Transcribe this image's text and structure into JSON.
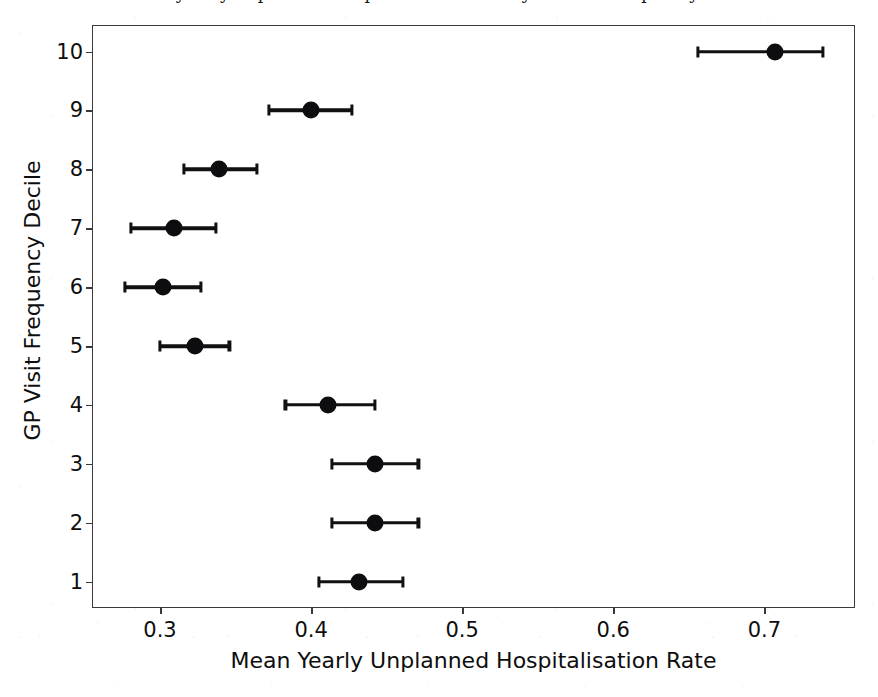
{
  "figure": {
    "width": 878,
    "height": 697,
    "background_color": "#ffffff",
    "frame_color": "#3a3a3c",
    "marker_color": "#0d0d0f",
    "title_cropped_note": "title row is cut off at the top edge of the screenshot; only letter descenders are visible"
  },
  "chart_data": {
    "type": "scatter",
    "orientation": "horizontal",
    "title": "",
    "xlabel": "Mean Yearly Unplanned Hospitalisation Rate",
    "ylabel": "GP Visit Frequency Decile",
    "xlim": [
      0.255,
      0.76
    ],
    "ylim": [
      0.55,
      10.45
    ],
    "xticks": [
      0.3,
      0.4,
      0.5,
      0.6,
      0.7
    ],
    "xtick_labels": [
      "0.3",
      "0.4",
      "0.5",
      "0.6",
      "0.7"
    ],
    "yticks": [
      1,
      2,
      3,
      4,
      5,
      6,
      7,
      8,
      9,
      10
    ],
    "ytick_labels": [
      "1",
      "2",
      "3",
      "4",
      "5",
      "6",
      "7",
      "8",
      "9",
      "10"
    ],
    "grid": false,
    "legend": false,
    "series_name": "Mean yearly unplanned hospitalisation rate by GP visit frequency decile",
    "points": [
      {
        "decile": 1,
        "value": 0.432,
        "ci_low": 0.405,
        "ci_high": 0.461
      },
      {
        "decile": 2,
        "value": 0.442,
        "ci_low": 0.414,
        "ci_high": 0.471
      },
      {
        "decile": 3,
        "value": 0.442,
        "ci_low": 0.414,
        "ci_high": 0.471
      },
      {
        "decile": 4,
        "value": 0.411,
        "ci_low": 0.383,
        "ci_high": 0.442
      },
      {
        "decile": 5,
        "value": 0.323,
        "ci_low": 0.3,
        "ci_high": 0.346
      },
      {
        "decile": 6,
        "value": 0.302,
        "ci_low": 0.277,
        "ci_high": 0.327
      },
      {
        "decile": 7,
        "value": 0.309,
        "ci_low": 0.281,
        "ci_high": 0.337
      },
      {
        "decile": 8,
        "value": 0.339,
        "ci_low": 0.316,
        "ci_high": 0.364
      },
      {
        "decile": 9,
        "value": 0.4,
        "ci_low": 0.372,
        "ci_high": 0.427
      },
      {
        "decile": 10,
        "value": 0.707,
        "ci_low": 0.656,
        "ci_high": 0.739
      }
    ]
  }
}
